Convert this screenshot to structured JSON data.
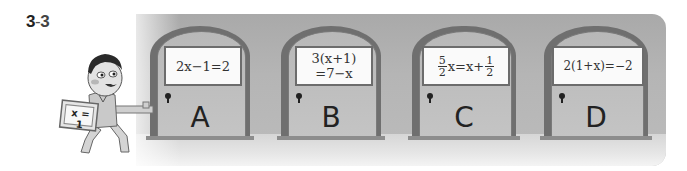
{
  "problem": {
    "number": "3",
    "separator": "-",
    "sub": "3"
  },
  "character": {
    "sign_text": "x = 1"
  },
  "doors": [
    {
      "label": "A",
      "equation": "2x−1=2"
    },
    {
      "label": "B",
      "equation_line1": "3(x+1)",
      "equation_line2": "=7−x"
    },
    {
      "label": "C",
      "frac1_num": "5",
      "frac1_den": "2",
      "mid": "x=x+",
      "frac2_num": "1",
      "frac2_den": "2"
    },
    {
      "label": "D",
      "equation": "2(1+x)=−2"
    }
  ],
  "colors": {
    "wall": "#b5b5b5",
    "frame": "#6f6f6f",
    "sign_bg": "#fafafa",
    "text": "#222222"
  }
}
